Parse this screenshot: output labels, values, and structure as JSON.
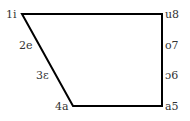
{
  "diagram": {
    "type": "quadrilateral",
    "stroke_color": "#000000",
    "stroke_width": 2,
    "background": "#ffffff",
    "vertices": [
      {
        "id": "top-left",
        "x": 22,
        "y": 14
      },
      {
        "id": "top-right",
        "x": 162,
        "y": 14
      },
      {
        "id": "bottom-right",
        "x": 162,
        "y": 106
      },
      {
        "id": "bottom-left",
        "x": 73,
        "y": 106
      }
    ],
    "labels": {
      "top_left": "1i",
      "left_upper": "2e",
      "left_lower": "3ε",
      "bottom_left": "4a",
      "bottom_right": "a5",
      "right_lower": "ɔ6",
      "right_upper": "o7",
      "top_right": "u8"
    }
  }
}
